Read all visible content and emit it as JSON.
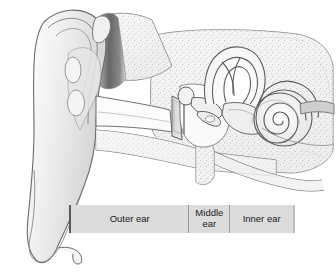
{
  "figure": {
    "type": "anatomical-illustration",
    "style": "grayscale line drawing with stippled bone texture"
  },
  "legend": {
    "bar": {
      "x": 69,
      "y": 205,
      "width": 226,
      "height": 28,
      "fill": "#dcdcdc",
      "separator_color": "#9a9a9a",
      "edge_color": "#5a5a5a",
      "text_color": "#1a1a1a"
    },
    "segments": [
      {
        "id": "outer",
        "label": "Outer ear",
        "width": 118
      },
      {
        "id": "middle",
        "label": "Middle\near",
        "label_line1": "Middle",
        "label_line2": "ear",
        "width": 40
      },
      {
        "id": "inner",
        "label": "Inner ear",
        "width": 63
      }
    ]
  },
  "anatomy": {
    "palette": {
      "outline": "#6b6b6b",
      "outline_dark": "#4a4a4a",
      "fill_light": "#f2f2f2",
      "fill_mid": "#e2e2e2",
      "fill_shadow": "#cfcfcf",
      "canal_dark": "#5c5c5c",
      "stipple": "#a8a8a8",
      "background": "#ffffff"
    },
    "parts": [
      "pinna",
      "helix",
      "antihelix",
      "concha",
      "earlobe",
      "ear-canal",
      "eardrum",
      "malleus",
      "incus",
      "stapes",
      "semicircular-canals",
      "vestibule",
      "cochlea",
      "auditory-nerve",
      "eustachian-tube",
      "temporal-bone"
    ]
  }
}
